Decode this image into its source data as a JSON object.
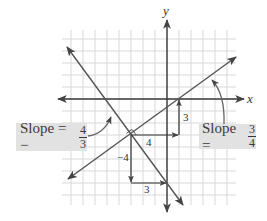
{
  "diagram": {
    "axes": {
      "x_label": "x",
      "y_label": "y"
    },
    "grid": {
      "unit_px": 12,
      "origin_px": [
        167,
        99
      ],
      "x_range": [
        -8,
        5
      ],
      "y_range": [
        -8,
        5
      ]
    },
    "lines": [
      {
        "name": "line-slope-positive",
        "slope": "3/4",
        "through": [
          [
            -3,
            -3
          ],
          [
            1,
            0
          ]
        ]
      },
      {
        "name": "line-slope-negative",
        "slope": "-4/3",
        "through": [
          [
            -3,
            -3
          ],
          [
            0,
            -7
          ]
        ]
      }
    ],
    "intersection": [
      -3,
      -3
    ],
    "right_angle_marker": true,
    "run_rise_labels": {
      "run_positive": "4",
      "rise_positive": "3",
      "rise_negative": "−4",
      "run_negative": "3"
    },
    "callouts": {
      "left": {
        "prefix": "Slope = −",
        "numerator": "4",
        "denominator": "3"
      },
      "right": {
        "prefix": "Slope = ",
        "numerator": "3",
        "denominator": "4"
      }
    },
    "colors": {
      "line": "#555555",
      "grid": "#d8d8d8",
      "axis": "#333333",
      "label_bg": "#e2e2e2"
    }
  }
}
